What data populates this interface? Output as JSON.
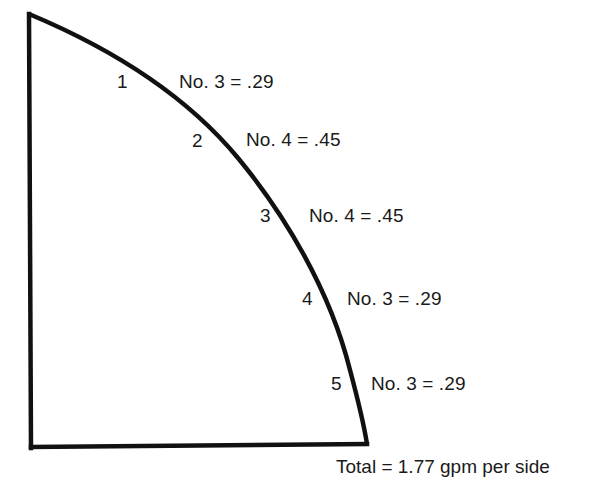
{
  "diagram": {
    "type": "quarter-circle nozzle layout",
    "stroke_color": "#111111",
    "background": "#ffffff",
    "nozzles": [
      {
        "position": "1",
        "label": "No. 3 = .29",
        "nozzle_no": "3",
        "flow": ".29"
      },
      {
        "position": "2",
        "label": "No. 4 = .45",
        "nozzle_no": "4",
        "flow": ".45"
      },
      {
        "position": "3",
        "label": "No. 4 = .45",
        "nozzle_no": "4",
        "flow": ".45"
      },
      {
        "position": "4",
        "label": "No. 3 = .29",
        "nozzle_no": "3",
        "flow": ".29"
      },
      {
        "position": "5",
        "label": "No. 3 = .29",
        "nozzle_no": "3",
        "flow": ".29"
      }
    ],
    "total": "Total = 1.77 gpm per side"
  }
}
